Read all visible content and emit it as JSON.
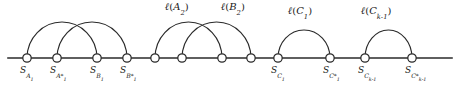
{
  "figure": {
    "width": 462,
    "height": 85,
    "background": "#ffffff",
    "stroke_color": "#2a2a2a",
    "text_color": "#1a1a1a",
    "baseline_y": 58,
    "axis_x_start": 8,
    "axis_x_end": 452,
    "node_radius": 4.2
  },
  "nodes": [
    {
      "id": "sa1",
      "x": 27,
      "label_base": "S",
      "sub": "A",
      "sub_index": "1",
      "star": false
    },
    {
      "id": "sa1s",
      "x": 57,
      "label_base": "S",
      "sub": "A",
      "sub_index": "1",
      "star": true
    },
    {
      "id": "sb1",
      "x": 97,
      "label_base": "S",
      "sub": "B",
      "sub_index": "1",
      "star": false
    },
    {
      "id": "sb1s",
      "x": 127,
      "label_base": "S",
      "sub": "B",
      "sub_index": "1",
      "star": true
    },
    {
      "id": "sa2",
      "x": 155,
      "label_base": "",
      "sub": "",
      "sub_index": "",
      "star": false
    },
    {
      "id": "sa2s",
      "x": 182,
      "label_base": "",
      "sub": "",
      "sub_index": "",
      "star": false
    },
    {
      "id": "sb2",
      "x": 222,
      "label_base": "",
      "sub": "",
      "sub_index": "",
      "star": false
    },
    {
      "id": "sb2s",
      "x": 251,
      "label_base": "",
      "sub": "",
      "sub_index": "",
      "star": false
    },
    {
      "id": "sc1",
      "x": 278,
      "label_base": "S",
      "sub": "C",
      "sub_index": "1",
      "star": false
    },
    {
      "id": "sc1s",
      "x": 330,
      "label_base": "S",
      "sub": "C",
      "sub_index": "1",
      "star": true
    },
    {
      "id": "sck",
      "x": 365,
      "label_base": "S",
      "sub": "C",
      "sub_index": "k-1",
      "star": false
    },
    {
      "id": "scks",
      "x": 412,
      "label_base": "S",
      "sub": "C",
      "sub_index": "k-1",
      "star": true
    }
  ],
  "node_labels": [
    {
      "x": 27,
      "text": "S",
      "sub": "A",
      "idx": "1",
      "star": ""
    },
    {
      "x": 57,
      "text": "S",
      "sub": "A",
      "idx": "1",
      "star": "*"
    },
    {
      "x": 97,
      "text": "S",
      "sub": "B",
      "idx": "1",
      "star": ""
    },
    {
      "x": 127,
      "text": "S",
      "sub": "B",
      "idx": "1",
      "star": "*"
    },
    {
      "x": 278,
      "text": "S",
      "sub": "C",
      "idx": "1",
      "star": ""
    },
    {
      "x": 330,
      "text": "S",
      "sub": "C",
      "idx": "1",
      "star": "*"
    },
    {
      "x": 365,
      "text": "S",
      "sub": "C",
      "idx": "k-1",
      "star": ""
    },
    {
      "x": 412,
      "text": "S",
      "sub": "C",
      "idx": "k-1",
      "star": "*"
    }
  ],
  "arcs": [
    {
      "id": "arc-a1",
      "from_x": 27,
      "to_x": 97,
      "height": 36,
      "crossing": true
    },
    {
      "id": "arc-b1",
      "from_x": 57,
      "to_x": 127,
      "height": 36,
      "crossing": true
    },
    {
      "id": "arc-a2",
      "from_x": 155,
      "to_x": 222,
      "height": 36,
      "crossing": true
    },
    {
      "id": "arc-b2",
      "from_x": 182,
      "to_x": 251,
      "height": 36,
      "crossing": true
    },
    {
      "id": "arc-c1",
      "from_x": 278,
      "to_x": 330,
      "height": 28,
      "crossing": false
    },
    {
      "id": "arc-ck",
      "from_x": 365,
      "to_x": 412,
      "height": 28,
      "crossing": false
    }
  ],
  "arc_labels": [
    {
      "id": "lbl-a2",
      "x": 165,
      "y": 2,
      "ell": "ℓ",
      "arg": "A",
      "idx": "2"
    },
    {
      "id": "lbl-b2",
      "x": 221,
      "y": 2,
      "ell": "ℓ",
      "arg": "B",
      "idx": "2"
    },
    {
      "id": "lbl-c1",
      "x": 288,
      "y": 6,
      "ell": "ℓ",
      "arg": "C",
      "idx": "1"
    },
    {
      "id": "lbl-ck",
      "x": 361,
      "y": 6,
      "ell": "ℓ",
      "arg": "C",
      "idx": "k-1"
    }
  ]
}
